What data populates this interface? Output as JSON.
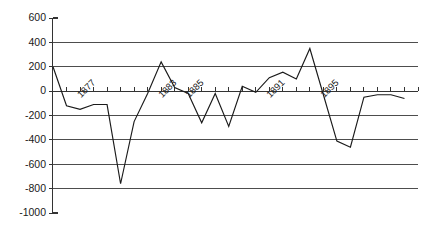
{
  "chart_data": {
    "type": "line",
    "title": "",
    "subtitle": "",
    "xlabel": "",
    "ylabel": "",
    "ylim": [
      -1000,
      600
    ],
    "yticks": [
      600,
      400,
      200,
      0,
      -200,
      -400,
      -600,
      -800,
      -1000
    ],
    "ytick_labels": [
      "600",
      "400",
      "200",
      "0",
      "-200",
      "-400",
      "-600",
      "-800",
      "-1000"
    ],
    "grid": true,
    "grid_axis": "y",
    "legend": false,
    "legend_position": "none",
    "xlim": [
      1875,
      1902
    ],
    "xticks": [
      1875,
      1876,
      1877,
      1878,
      1879,
      1880,
      1881,
      1882,
      1883,
      1884,
      1885,
      1886,
      1887,
      1888,
      1889,
      1890,
      1891,
      1892,
      1893,
      1894,
      1895,
      1896,
      1897,
      1898,
      1899,
      1900,
      1901,
      1902
    ],
    "xtick_labels_shown": [
      "1877",
      "1883",
      "1885",
      "1891",
      "1895"
    ],
    "xtick_label_years": [
      1877,
      1883,
      1885,
      1891,
      1895
    ],
    "xtick_label_rotation": 45,
    "line_color": "#1a1a1a",
    "grid_color": "#4d4d4d",
    "series": [
      {
        "name": "series-1",
        "x": [
          1875,
          1876,
          1877,
          1878,
          1879,
          1880,
          1881,
          1882,
          1883,
          1884,
          1885,
          1886,
          1887,
          1888,
          1889,
          1890,
          1891,
          1892,
          1893,
          1894,
          1895,
          1896,
          1897,
          1898,
          1899,
          1900,
          1901
        ],
        "values": [
          200,
          -120,
          -150,
          -110,
          -110,
          -760,
          -250,
          -20,
          240,
          30,
          -20,
          -260,
          -20,
          -290,
          40,
          -10,
          110,
          155,
          100,
          350,
          -30,
          -410,
          -460,
          -50,
          -30,
          -30,
          -60
        ]
      }
    ]
  },
  "axes": {
    "y_axis_name": "value-axis",
    "x_axis_name": "year-axis"
  }
}
